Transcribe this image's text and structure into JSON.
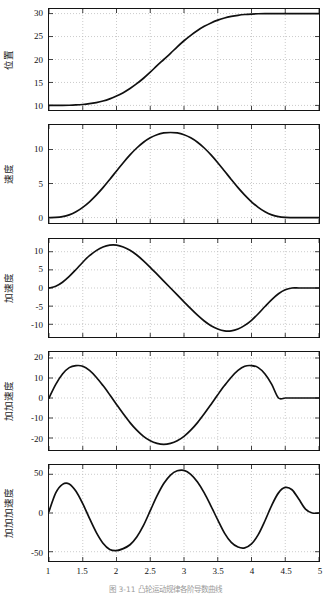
{
  "figure": {
    "caption": "图 3-11  凸轮运动规律各阶导数曲线",
    "line_color": "#101010",
    "grid_color": "#b4b4b4",
    "axis_color": "#141414",
    "background": "#ffffff"
  },
  "axis": {
    "x_min": 1,
    "x_max": 5,
    "x_ticks": [
      1,
      1.5,
      2,
      2.5,
      3,
      3.5,
      4,
      4.5,
      5
    ],
    "x_tick_labels": [
      "1",
      "1.5",
      "2",
      "2.5",
      "3",
      "3.5",
      "4",
      "4.5",
      "5"
    ]
  },
  "chart_data": [
    {
      "type": "line",
      "title": "",
      "xlabel": "",
      "ylabel": "位置",
      "xlim": [
        1,
        5
      ],
      "ylim": [
        9,
        31
      ],
      "y_ticks": [
        10,
        15,
        20,
        25,
        30
      ],
      "y_tick_labels": [
        "10",
        "15",
        "20",
        "25",
        "30"
      ],
      "grid": true,
      "legend": null,
      "series": [
        {
          "name": "位置",
          "x": [
            1,
            1.1,
            1.2,
            1.3,
            1.4,
            1.5,
            1.6,
            1.7,
            1.8,
            1.9,
            2,
            2.1,
            2.2,
            2.3,
            2.4,
            2.5,
            2.6,
            2.7,
            2.8,
            2.9,
            3,
            3.1,
            3.2,
            3.3,
            3.4,
            3.5,
            3.6,
            3.7,
            3.8,
            3.9,
            4,
            4.1,
            4.2,
            4.3,
            4.4,
            4.5,
            4.6,
            4.7,
            4.8,
            4.9,
            5
          ],
          "values": [
            10.0,
            10.0,
            10.01,
            10.04,
            10.1,
            10.2,
            10.37,
            10.62,
            10.96,
            11.43,
            12.03,
            12.78,
            13.68,
            14.73,
            15.92,
            17.24,
            18.65,
            20.0,
            21.35,
            22.76,
            24.08,
            25.27,
            26.32,
            27.22,
            27.97,
            28.57,
            29.04,
            29.38,
            29.63,
            29.8,
            29.9,
            29.96,
            29.99,
            30.0,
            30.0,
            30.0,
            30.0,
            30.0,
            30.0,
            30.0,
            30.0
          ]
        }
      ]
    },
    {
      "type": "line",
      "title": "",
      "xlabel": "",
      "ylabel": "速度",
      "xlim": [
        1,
        5
      ],
      "ylim": [
        -0.8,
        13.6
      ],
      "y_ticks": [
        0,
        5,
        10
      ],
      "y_tick_labels": [
        "0",
        "5",
        "10"
      ],
      "grid": true,
      "legend": null,
      "series": [
        {
          "name": "速度",
          "x": [
            1,
            1.1,
            1.2,
            1.3,
            1.4,
            1.5,
            1.6,
            1.7,
            1.8,
            1.9,
            2,
            2.1,
            2.2,
            2.3,
            2.4,
            2.5,
            2.6,
            2.7,
            2.8,
            2.9,
            3,
            3.1,
            3.2,
            3.3,
            3.4,
            3.5,
            3.6,
            3.7,
            3.8,
            3.9,
            4,
            4.1,
            4.2,
            4.3,
            4.4,
            4.5,
            4.6,
            4.7,
            4.8,
            4.9,
            5
          ],
          "values": [
            0.0,
            0.02,
            0.13,
            0.4,
            0.85,
            1.5,
            2.32,
            3.3,
            4.4,
            5.6,
            6.84,
            8.06,
            9.2,
            10.22,
            11.07,
            11.72,
            12.17,
            12.43,
            12.5,
            12.43,
            12.17,
            11.72,
            11.07,
            10.22,
            9.2,
            8.06,
            6.84,
            5.6,
            4.4,
            3.3,
            2.32,
            1.5,
            0.85,
            0.4,
            0.13,
            0.02,
            0.0,
            0.0,
            0.0,
            0.0,
            0.0
          ]
        }
      ]
    },
    {
      "type": "line",
      "title": "",
      "xlabel": "",
      "ylabel": "加速度",
      "xlim": [
        1,
        5
      ],
      "ylim": [
        -13.5,
        13.5
      ],
      "y_ticks": [
        -10,
        -5,
        0,
        5,
        10
      ],
      "y_tick_labels": [
        "-10",
        "-5",
        "0",
        "5",
        "10"
      ],
      "grid": true,
      "legend": null,
      "series": [
        {
          "name": "加速度",
          "x": [
            1,
            1.1,
            1.2,
            1.3,
            1.4,
            1.5,
            1.6,
            1.7,
            1.8,
            1.9,
            2,
            2.1,
            2.2,
            2.3,
            2.4,
            2.5,
            2.6,
            2.7,
            2.8,
            2.9,
            3,
            3.1,
            3.2,
            3.3,
            3.4,
            3.5,
            3.6,
            3.7,
            3.8,
            3.9,
            4,
            4.1,
            4.2,
            4.3,
            4.4,
            4.5,
            4.6,
            4.7,
            4.8,
            4.9,
            5
          ],
          "values": [
            0.0,
            0.5,
            1.6,
            3.2,
            5.1,
            7.1,
            8.9,
            10.3,
            11.3,
            11.8,
            11.8,
            11.3,
            10.4,
            9.1,
            7.5,
            5.7,
            3.8,
            1.9,
            0.0,
            -1.9,
            -3.8,
            -5.7,
            -7.5,
            -9.1,
            -10.4,
            -11.3,
            -11.8,
            -11.8,
            -11.3,
            -10.3,
            -8.9,
            -7.1,
            -5.1,
            -3.2,
            -1.6,
            -0.5,
            0.0,
            0.0,
            0.0,
            0.0,
            0.0
          ]
        }
      ]
    },
    {
      "type": "line",
      "title": "",
      "xlabel": "",
      "ylabel": "加加速度",
      "xlim": [
        1,
        5
      ],
      "ylim": [
        -26,
        23
      ],
      "y_ticks": [
        -20,
        -10,
        0,
        10,
        20
      ],
      "y_tick_labels": [
        "-20",
        "-10",
        "0",
        "10",
        "20"
      ],
      "grid": true,
      "legend": null,
      "series": [
        {
          "name": "加加速度",
          "x": [
            1,
            1.1,
            1.2,
            1.3,
            1.4,
            1.5,
            1.6,
            1.7,
            1.8,
            1.9,
            2,
            2.1,
            2.2,
            2.3,
            2.4,
            2.5,
            2.6,
            2.7,
            2.8,
            2.9,
            3,
            3.1,
            3.2,
            3.3,
            3.4,
            3.5,
            3.6,
            3.7,
            3.8,
            3.9,
            4,
            4.1,
            4.2,
            4.3,
            4.4,
            4.5,
            4.6,
            4.7,
            4.8,
            4.9,
            5
          ],
          "values": [
            0.0,
            6.8,
            12.0,
            15.2,
            16.2,
            15.9,
            13.8,
            10.4,
            6.2,
            1.6,
            -3.2,
            -7.9,
            -12.3,
            -16.1,
            -19.2,
            -21.4,
            -22.7,
            -23.2,
            -22.7,
            -21.4,
            -19.2,
            -16.1,
            -12.3,
            -7.9,
            -3.2,
            1.6,
            6.2,
            10.4,
            13.8,
            15.9,
            16.2,
            15.2,
            12.0,
            6.8,
            0.0,
            0.0,
            0.0,
            0.0,
            0.0,
            0.0,
            0.0
          ]
        }
      ]
    },
    {
      "type": "line",
      "title": "",
      "xlabel": "",
      "ylabel": "加加加速度",
      "xlim": [
        1,
        5
      ],
      "ylim": [
        -62,
        62
      ],
      "y_ticks": [
        -50,
        0,
        50
      ],
      "y_tick_labels": [
        "-50",
        "0",
        "50"
      ],
      "grid": true,
      "legend": null,
      "series": [
        {
          "name": "加加加速度",
          "x": [
            1,
            1.1,
            1.2,
            1.3,
            1.4,
            1.5,
            1.6,
            1.7,
            1.8,
            1.9,
            2,
            2.1,
            2.2,
            2.3,
            2.4,
            2.5,
            2.6,
            2.7,
            2.8,
            2.9,
            3,
            3.1,
            3.2,
            3.3,
            3.4,
            3.5,
            3.6,
            3.7,
            3.8,
            3.9,
            4,
            4.1,
            4.2,
            4.3,
            4.4,
            4.5,
            4.6,
            4.7,
            4.8,
            4.9,
            5
          ],
          "values": [
            2.0,
            26.0,
            37.0,
            37.5,
            28.0,
            12.0,
            -7.0,
            -25.0,
            -39.0,
            -47.0,
            -48.5,
            -46.0,
            -41.0,
            -31.0,
            -16.0,
            3.0,
            22.0,
            38.0,
            49.0,
            54.5,
            55.0,
            50.0,
            40.0,
            26.0,
            9.0,
            -9.0,
            -26.0,
            -38.0,
            -44.0,
            -45.0,
            -40.0,
            -28.0,
            -10.0,
            10.0,
            26.0,
            33.0,
            30.0,
            18.0,
            5.0,
            0.0,
            0.0
          ]
        }
      ]
    }
  ]
}
